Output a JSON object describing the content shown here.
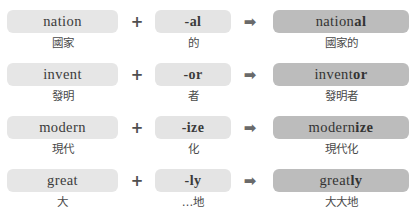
{
  "page": {
    "colors": {
      "chip_light": "#e6e6e6",
      "chip_suffix": "#e4e4e4",
      "chip_result": "#bcbcbc",
      "text": "#3b3b3b",
      "gloss_text": "#4a4a4a",
      "background": "#ffffff"
    }
  },
  "operators": {
    "plus": "+",
    "arrow": "➡",
    "plus_name": "plus-sign",
    "arrow_name": "arrow-right-icon"
  },
  "rows": [
    {
      "base": {
        "word": "nation",
        "gloss": "國家"
      },
      "suffix": {
        "word": "-al",
        "gloss": "的"
      },
      "result": {
        "stem": "nation",
        "affix": "al",
        "word": "national",
        "gloss": "國家的"
      }
    },
    {
      "base": {
        "word": "invent",
        "gloss": "發明"
      },
      "suffix": {
        "word": "-or",
        "gloss": "者"
      },
      "result": {
        "stem": "invent",
        "affix": "or",
        "word": "inventor",
        "gloss": "發明者"
      }
    },
    {
      "base": {
        "word": "modern",
        "gloss": "現代"
      },
      "suffix": {
        "word": "-ize",
        "gloss": "化"
      },
      "result": {
        "stem": "modern",
        "affix": "ize",
        "word": "modernize",
        "gloss": "現代化"
      }
    },
    {
      "base": {
        "word": "great",
        "gloss": "大"
      },
      "suffix": {
        "word": "-ly",
        "gloss": "…地"
      },
      "result": {
        "stem": "great",
        "affix": "ly",
        "word": "greatly",
        "gloss": "大大地"
      }
    }
  ]
}
